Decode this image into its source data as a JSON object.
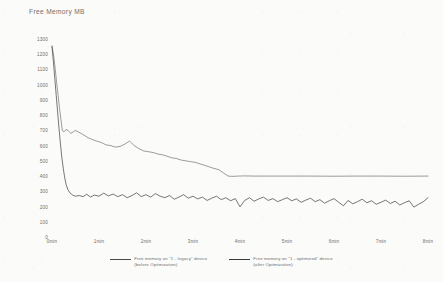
{
  "chart_data": {
    "type": "line",
    "title": "Free Memory  MB",
    "xlabel": "",
    "ylabel": "",
    "ylim": [
      0,
      1300
    ],
    "ytick_step": 100,
    "yticks": [
      "1300",
      "1200",
      "1100",
      "1000",
      "900",
      "800",
      "700",
      "600",
      "500",
      "400",
      "300",
      "200",
      "100",
      "0"
    ],
    "xticks": [
      "0min",
      "1min",
      "2min",
      "3min",
      "4min",
      "5min",
      "6min",
      "7min",
      "8min"
    ],
    "xlim": [
      0,
      8
    ],
    "grid": false,
    "legend_position": "bottom",
    "series": [
      {
        "name": "Free memory on \"1 - legacy\" device",
        "name_line2": "(before Optimization)",
        "color": "#4a4a4a",
        "x": [
          0.0,
          0.04,
          0.07,
          0.1,
          0.13,
          0.16,
          0.19,
          0.22,
          0.25,
          0.28,
          0.31,
          0.34,
          0.37,
          0.4,
          0.45,
          0.5,
          0.56,
          0.62,
          0.7,
          0.78,
          0.86,
          0.95,
          1.05,
          1.15,
          1.25,
          1.35,
          1.45,
          1.55,
          1.65,
          1.75,
          1.85,
          1.95,
          2.05,
          2.15,
          2.25,
          2.35,
          2.45,
          2.55,
          2.65,
          2.75,
          2.85,
          2.95,
          3.05,
          3.15,
          3.25,
          3.35,
          3.45,
          3.55,
          3.65,
          3.75,
          3.85,
          3.95,
          4.1,
          4.3,
          4.6,
          5.0,
          5.5,
          6.0,
          6.5,
          7.0,
          7.5,
          8.0
        ],
        "y": [
          1255,
          1180,
          1100,
          1010,
          930,
          845,
          770,
          700,
          690,
          700,
          705,
          700,
          690,
          680,
          690,
          700,
          690,
          680,
          665,
          650,
          640,
          630,
          620,
          605,
          600,
          590,
          595,
          610,
          630,
          600,
          580,
          565,
          560,
          555,
          545,
          540,
          530,
          520,
          515,
          505,
          500,
          495,
          490,
          480,
          470,
          460,
          450,
          442,
          420,
          400,
          398,
          400,
          401,
          400,
          400,
          400,
          400,
          399,
          400,
          400,
          399,
          400
        ]
      },
      {
        "name": "Free memory on \"1 - optimized\" device",
        "name_line2": "(after Optimization)",
        "color": "#3a3a3a",
        "x": [
          0.0,
          0.03,
          0.06,
          0.09,
          0.12,
          0.15,
          0.18,
          0.21,
          0.24,
          0.27,
          0.3,
          0.34,
          0.38,
          0.44,
          0.5,
          0.58,
          0.66,
          0.74,
          0.82,
          0.9,
          1.0,
          1.1,
          1.2,
          1.3,
          1.4,
          1.5,
          1.6,
          1.7,
          1.8,
          1.9,
          2.0,
          2.1,
          2.2,
          2.3,
          2.4,
          2.5,
          2.6,
          2.7,
          2.8,
          2.9,
          3.0,
          3.1,
          3.2,
          3.3,
          3.4,
          3.5,
          3.6,
          3.7,
          3.8,
          3.9,
          4.0,
          4.1,
          4.2,
          4.3,
          4.4,
          4.5,
          4.6,
          4.7,
          4.8,
          4.9,
          5.0,
          5.1,
          5.2,
          5.3,
          5.4,
          5.5,
          5.6,
          5.7,
          5.8,
          5.9,
          6.0,
          6.1,
          6.2,
          6.3,
          6.4,
          6.5,
          6.6,
          6.7,
          6.8,
          6.9,
          7.0,
          7.1,
          7.2,
          7.3,
          7.4,
          7.5,
          7.6,
          7.7,
          7.8,
          7.9,
          8.0
        ],
        "y": [
          1250,
          1150,
          1040,
          930,
          820,
          710,
          610,
          520,
          450,
          390,
          345,
          310,
          290,
          275,
          268,
          272,
          265,
          280,
          262,
          275,
          268,
          288,
          270,
          282,
          265,
          278,
          258,
          272,
          290,
          265,
          278,
          262,
          285,
          268,
          258,
          272,
          248,
          262,
          278,
          255,
          268,
          250,
          262,
          240,
          255,
          268,
          245,
          258,
          238,
          252,
          198,
          240,
          258,
          235,
          250,
          262,
          240,
          252,
          232,
          245,
          258,
          238,
          250,
          228,
          242,
          255,
          232,
          245,
          222,
          238,
          252,
          228,
          205,
          240,
          218,
          232,
          248,
          225,
          238,
          215,
          228,
          242,
          220,
          235,
          210,
          225,
          238,
          196,
          215,
          232,
          258
        ]
      }
    ]
  }
}
